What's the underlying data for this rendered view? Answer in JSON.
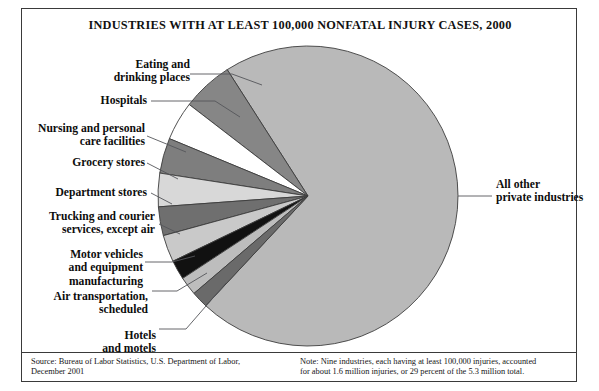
{
  "figure": {
    "title": "INDUSTRIES WITH AT LEAST 100,000 NONFATAL INJURY CASES, 2000",
    "source_note": "Source: Bureau of Labor Statistics, U.S. Department of Labor,\nDecember 2001",
    "note": "Note: Nine industries, each having at least 100,000 injuries, accounted\n      for about 1.6 million injuries, or 29 percent of the 5.3 million total."
  },
  "labels": {
    "eating": "Eating and\ndrinking places",
    "hospitals": "Hospitals",
    "nursing": "Nursing and personal\ncare facilities",
    "grocery": "Grocery stores",
    "department": "Department stores",
    "trucking": "Trucking and courier\nservices, except air",
    "motor": "Motor vehicles\nand equipment\nmanufacturing",
    "air": "Air transportation,\nscheduled",
    "hotels": "Hotels\nand motels",
    "other": "All other\nprivate industries"
  },
  "chart_data": {
    "type": "pie",
    "title": "INDUSTRIES WITH AT LEAST 100,000 NONFATAL INJURY CASES, 2000",
    "unit": "percent of 5.3 million total nonfatal injury cases",
    "total_cases_millions": 5.3,
    "nine_industries_cases_millions": 1.6,
    "nine_industries_percent": 29,
    "legend_position": "callout-labels",
    "grid": false,
    "categories": [
      "All other private industries",
      "Eating and drinking places",
      "Hospitals",
      "Nursing and personal care facilities",
      "Grocery stores",
      "Department stores",
      "Trucking and courier services, except air",
      "Motor vehicles and equipment manufacturing",
      "Air transportation, scheduled",
      "Hotels and motels"
    ],
    "values": [
      71,
      5.5,
      4.2,
      3.8,
      3.6,
      3.1,
      2.9,
      2.1,
      2.0,
      1.8
    ],
    "colors": [
      "#b9b9b9",
      "#868686",
      "#ffffff",
      "#7e7e7e",
      "#d8d8d8",
      "#6f6f6f",
      "#c9c9c9",
      "#111111",
      "#bdbdbd",
      "#6a6a6a"
    ],
    "slice_angles_deg": {
      "start_of_other": -133,
      "end_of_other": 153.5,
      "direction": "counterclockwise from 3 o'clock"
    }
  },
  "geometry": {
    "center_x": 308,
    "center_y": 196,
    "radius": 150
  }
}
